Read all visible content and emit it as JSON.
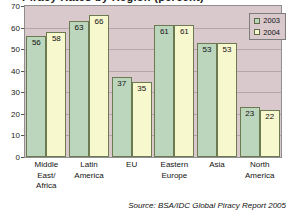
{
  "chart_data": {
    "type": "bar",
    "title": "Piracy Rates by Region (percent)",
    "xlabel": "",
    "ylabel": "",
    "ylim": [
      0,
      70
    ],
    "yticks": [
      0,
      10,
      20,
      30,
      40,
      50,
      60,
      70
    ],
    "grid": true,
    "legend_position": "top-right",
    "categories": [
      [
        "Middle",
        "East/",
        "Africa"
      ],
      [
        "Latin",
        "America"
      ],
      [
        "EU"
      ],
      [
        "Eastern",
        "Europe"
      ],
      [
        "Asia"
      ],
      [
        "North",
        "America"
      ]
    ],
    "category_labels": [
      "Middle East/ Africa",
      "Latin America",
      "EU",
      "Eastern Europe",
      "Asia",
      "North America"
    ],
    "series": [
      {
        "name": "2003",
        "color": "#bcd5bd",
        "values": [
          56,
          63,
          37,
          61,
          53,
          23
        ]
      },
      {
        "name": "2004",
        "color": "#f8f8cf",
        "values": [
          58,
          66,
          35,
          61,
          53,
          22
        ]
      }
    ],
    "source": "Source: BSA/IDC Global Piracy Report 2005",
    "plot_background": "#d9c9cd",
    "bar_border_color": "#6c7a52"
  },
  "legend": {
    "items": [
      {
        "label": "2003"
      },
      {
        "label": "2004"
      }
    ]
  }
}
